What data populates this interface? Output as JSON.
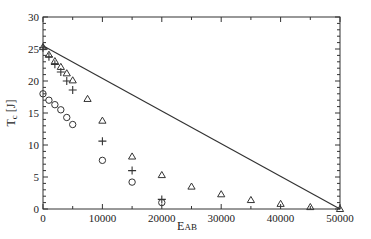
{
  "chart_data": {
    "type": "scatter",
    "title": "",
    "xlabel": "E",
    "xlabel_sub": "AB",
    "ylabel": "T",
    "ylabel_sub": "c",
    "ylabel_unit": "[J]",
    "xlim": [
      0,
      50000
    ],
    "ylim": [
      0,
      30
    ],
    "grid": false,
    "legend": null,
    "x_ticks": [
      0,
      10000,
      20000,
      30000,
      40000,
      50000
    ],
    "x_tick_labels": [
      "0",
      "10000",
      "20000",
      "30000",
      "40000",
      "50000"
    ],
    "y_ticks": [
      0,
      5,
      10,
      15,
      20,
      25,
      30
    ],
    "y_tick_labels": [
      "0",
      "5",
      "10",
      "15",
      "20",
      "25",
      "30"
    ],
    "line": {
      "name": "line",
      "style": "solid",
      "x": [
        0,
        50000
      ],
      "y": [
        25.5,
        0
      ]
    },
    "series": [
      {
        "name": "triangle",
        "marker": "triangle",
        "x": [
          0,
          1000,
          2000,
          3000,
          4000,
          5000,
          7500,
          10000,
          15000,
          20000,
          25000,
          30000,
          35000,
          40000,
          45000,
          50000
        ],
        "y": [
          25.3,
          24.1,
          23.1,
          22.2,
          21.2,
          20.1,
          17.2,
          13.8,
          8.2,
          5.3,
          3.5,
          2.3,
          1.4,
          0.8,
          0.3,
          0.0
        ]
      },
      {
        "name": "plus",
        "marker": "plus",
        "x": [
          0,
          1000,
          2000,
          3000,
          4000,
          5000,
          10000,
          15000,
          20000
        ],
        "y": [
          25.2,
          23.8,
          22.6,
          21.4,
          20.0,
          18.6,
          10.6,
          6.0,
          1.5
        ]
      },
      {
        "name": "circle",
        "marker": "circle",
        "x": [
          0,
          1000,
          2000,
          3000,
          4000,
          5000,
          10000,
          15000,
          20000
        ],
        "y": [
          18.0,
          17.0,
          16.3,
          15.5,
          14.3,
          13.2,
          7.6,
          4.2,
          1.0
        ]
      }
    ]
  },
  "colors": {
    "axis": "#333333",
    "marker": "#333333",
    "line": "#333333",
    "background": "#ffffff"
  }
}
